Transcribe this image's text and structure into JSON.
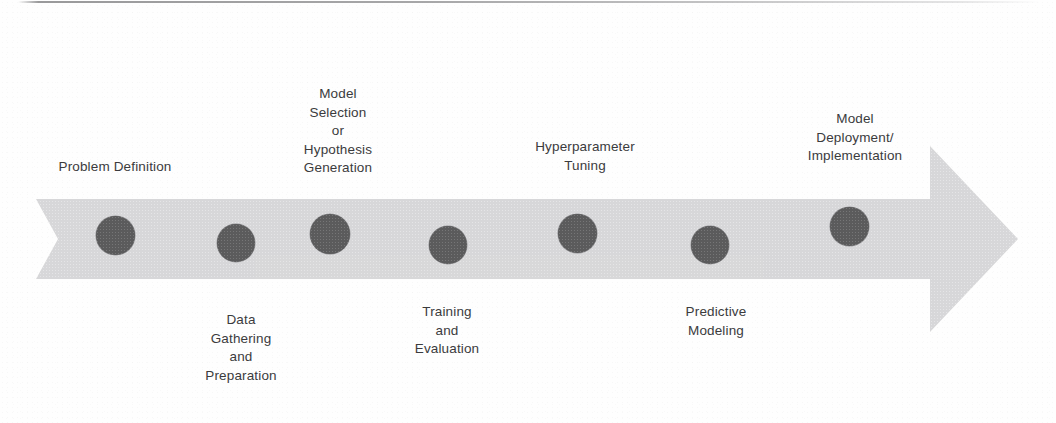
{
  "diagram": {
    "type": "process-arrow-timeline",
    "colors": {
      "arrow_band": "#d8d8d9",
      "milestone_dot": "#5b5b5c",
      "label_text": "#3b3b3d",
      "background": "#fefefe",
      "top_rule": "#78787a"
    },
    "arrow": {
      "direction": "right",
      "tail_style": "notched-chevron",
      "head_style": "triangle"
    },
    "steps": [
      {
        "index": 1,
        "name": "problem-definition",
        "lines": [
          "Problem Definition"
        ],
        "label_position": "above",
        "dot": {
          "cx": 115,
          "cy": 235,
          "d": 39
        },
        "label_center_x": 115,
        "label_top_y": 158
      },
      {
        "index": 2,
        "name": "data-gathering-and-preparation",
        "lines": [
          "Data",
          "Gathering",
          "and",
          "Preparation"
        ],
        "label_position": "below",
        "dot": {
          "cx": 236,
          "cy": 243,
          "d": 38
        },
        "label_center_x": 241,
        "label_top_y": 311
      },
      {
        "index": 3,
        "name": "model-selection-or-hypothesis-generation",
        "lines": [
          "Model",
          "Selection",
          "or",
          "Hypothesis",
          "Generation"
        ],
        "label_position": "above",
        "dot": {
          "cx": 330,
          "cy": 234,
          "d": 40
        },
        "label_center_x": 338,
        "label_top_y": 85
      },
      {
        "index": 4,
        "name": "training-and-evaluation",
        "lines": [
          "Training",
          "and",
          "Evaluation"
        ],
        "label_position": "below",
        "dot": {
          "cx": 448,
          "cy": 245,
          "d": 38
        },
        "label_center_x": 447,
        "label_top_y": 303
      },
      {
        "index": 5,
        "name": "hyperparameter-tuning",
        "lines": [
          "Hyperparameter",
          "Tuning"
        ],
        "label_position": "above",
        "dot": {
          "cx": 577,
          "cy": 233,
          "d": 39
        },
        "label_center_x": 585,
        "label_top_y": 138
      },
      {
        "index": 6,
        "name": "predictive-modeling",
        "lines": [
          "Predictive",
          "Modeling"
        ],
        "label_position": "below",
        "dot": {
          "cx": 710,
          "cy": 245,
          "d": 38
        },
        "label_center_x": 716,
        "label_top_y": 303
      },
      {
        "index": 7,
        "name": "model-deployment-implementation",
        "lines": [
          "Model",
          "Deployment/",
          "Implementation"
        ],
        "label_position": "above",
        "dot": {
          "cx": 849,
          "cy": 226,
          "d": 39
        },
        "label_center_x": 855,
        "label_top_y": 110
      }
    ]
  }
}
